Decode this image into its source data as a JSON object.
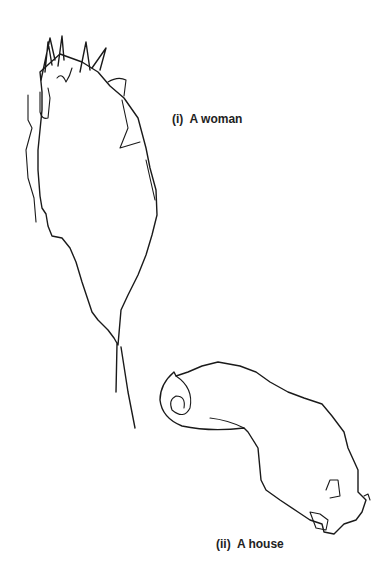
{
  "figure": {
    "drawings": [
      {
        "id": "woman",
        "caption": "(i)  A woman"
      },
      {
        "id": "house",
        "caption": "(ii)  A house"
      }
    ]
  }
}
